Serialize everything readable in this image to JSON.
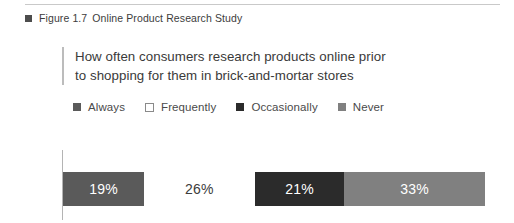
{
  "figure": {
    "bullet_icon": "square-bullet-icon",
    "number": "Figure 1.7",
    "title": "Online Product Research Study"
  },
  "headline": {
    "text": "How often consumers research products online prior to shopping for them in brick-and-mortar stores"
  },
  "legend": {
    "items": [
      {
        "label": "Always",
        "color": "#5a5a5a",
        "style": "filled"
      },
      {
        "label": "Frequently",
        "color": "#ffffff",
        "style": "hollow"
      },
      {
        "label": "Occasionally",
        "color": "#2b2b2b",
        "style": "filled"
      },
      {
        "label": "Never",
        "color": "#808080",
        "style": "filled"
      }
    ]
  },
  "chart_data": {
    "type": "bar",
    "orientation": "horizontal-stacked",
    "title": "How often consumers research products online prior to shopping for them in brick-and-mortar stores",
    "xlabel": "",
    "ylabel": "",
    "grid": false,
    "legend_position": "top",
    "categories": [
      "Always",
      "Frequently",
      "Occasionally",
      "Never"
    ],
    "values": [
      19,
      26,
      21,
      33
    ],
    "value_labels": [
      "19%",
      "26%",
      "21%",
      "33%"
    ],
    "colors": [
      "#5a5a5a",
      "#ffffff",
      "#2b2b2b",
      "#808080"
    ],
    "label_colors": [
      "#ffffff",
      "#3c3c3c",
      "#ffffff",
      "#ffffff"
    ],
    "total": 99,
    "units": "percent"
  }
}
